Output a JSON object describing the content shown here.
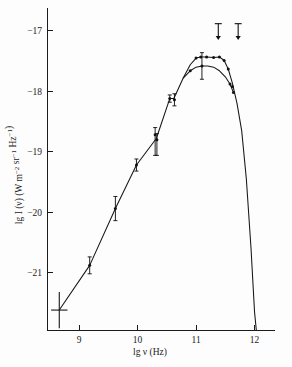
{
  "figure": {
    "title": "",
    "background_color": "#fdfdfd",
    "ink_color": "#161616"
  },
  "chart_data": {
    "type": "line",
    "title": "",
    "subtitle": "",
    "xlabel": "lg  ν  (Hz)",
    "ylabel": "lg I (ν) (W m⁻² sr⁻¹ Hz⁻¹)",
    "xlabel_parts": {
      "prefix": "lg",
      "variable": "ν",
      "unit": "(Hz)"
    },
    "ylabel_parts": {
      "prefix": "lg I (",
      "variable": "ν",
      "middle": ") (W m",
      "exp1": "−2",
      "mid2": " sr",
      "exp2": "−1",
      "mid3": " Hz",
      "exp3": "−1",
      "suffix": ")"
    },
    "xlim": [
      8.45,
      12.35
    ],
    "ylim": [
      -21.95,
      -16.72
    ],
    "xticks": [
      9,
      10,
      11,
      12
    ],
    "xtick_labels": [
      "9",
      "10",
      "11",
      "12"
    ],
    "yticks": [
      -17,
      -18,
      -19,
      -20,
      -21
    ],
    "ytick_labels": [
      "−17",
      "−18",
      "−19",
      "−20",
      "−21"
    ],
    "grid": false,
    "legend": null,
    "series": [
      {
        "name": "main-spectrum",
        "style": "solid-line-with-points",
        "x": [
          8.66,
          9.18,
          9.62,
          9.98,
          10.32,
          10.55,
          10.62,
          10.78,
          10.9,
          11.0,
          11.08,
          11.18,
          11.3,
          11.4,
          11.48,
          11.55,
          11.62,
          11.7,
          11.78,
          11.86,
          11.94,
          12.0,
          12.03
        ],
        "y": [
          -21.62,
          -20.88,
          -19.94,
          -19.22,
          -18.78,
          -18.12,
          -18.12,
          -17.78,
          -17.56,
          -17.45,
          -17.43,
          -17.43,
          -17.44,
          -17.43,
          -17.49,
          -17.63,
          -17.86,
          -18.2,
          -18.65,
          -19.45,
          -20.6,
          -21.65,
          -21.95
        ]
      },
      {
        "name": "secondary-branch",
        "style": "solid-line-with-points",
        "x": [
          10.78,
          10.9,
          11.0,
          11.1,
          11.2,
          11.3,
          11.4,
          11.5,
          11.58,
          11.64
        ],
        "y": [
          -17.78,
          -17.66,
          -17.6,
          -17.58,
          -17.58,
          -17.6,
          -17.66,
          -17.76,
          -17.88,
          -18.02
        ]
      }
    ],
    "data_points": [
      {
        "x": 8.66,
        "y": -21.62,
        "yerr_up": 0.3,
        "yerr_down": 0.3,
        "xerr": 0.14,
        "marker": "cross"
      },
      {
        "x": 9.18,
        "y": -20.88,
        "yerr_up": 0.14,
        "yerr_down": 0.14,
        "marker": "point"
      },
      {
        "x": 9.62,
        "y": -19.94,
        "yerr_up": 0.2,
        "yerr_down": 0.2,
        "marker": "point"
      },
      {
        "x": 9.98,
        "y": -19.22,
        "yerr_up": 0.1,
        "yerr_down": 0.1,
        "marker": "point"
      },
      {
        "x": 10.3,
        "y": -18.72,
        "yerr_up": 0.12,
        "yerr_down": 0.34,
        "marker": "point"
      },
      {
        "x": 10.33,
        "y": -18.8,
        "yerr_up": 0.1,
        "yerr_down": 0.26,
        "marker": "point"
      },
      {
        "x": 10.55,
        "y": -18.12,
        "yerr_up": 0.06,
        "yerr_down": 0.06,
        "marker": "point"
      },
      {
        "x": 10.63,
        "y": -18.14,
        "yerr_up": 0.1,
        "yerr_down": 0.1,
        "marker": "point"
      },
      {
        "x": 10.9,
        "y": -17.66,
        "yerr_up": 0.0,
        "yerr_down": 0.0,
        "marker": "point"
      },
      {
        "x": 11.0,
        "y": -17.45,
        "yerr_up": 0.0,
        "yerr_down": 0.0,
        "marker": "point"
      },
      {
        "x": 11.08,
        "y": -17.43,
        "yerr_up": 0.0,
        "yerr_down": 0.0,
        "marker": "point"
      },
      {
        "x": 11.18,
        "y": -17.43,
        "yerr_up": 0.0,
        "yerr_down": 0.0,
        "marker": "point"
      },
      {
        "x": 11.3,
        "y": -17.44,
        "yerr_up": 0.0,
        "yerr_down": 0.0,
        "marker": "point"
      },
      {
        "x": 11.4,
        "y": -17.43,
        "yerr_up": 0.0,
        "yerr_down": 0.0,
        "marker": "point"
      },
      {
        "x": 11.48,
        "y": -17.49,
        "yerr_up": 0.0,
        "yerr_down": 0.0,
        "marker": "point"
      },
      {
        "x": 11.1,
        "y": -17.58,
        "yerr_up": 0.22,
        "yerr_down": 0.22,
        "marker": "point"
      },
      {
        "x": 11.55,
        "y": -17.63,
        "yerr_up": 0.0,
        "yerr_down": 0.0,
        "marker": "point"
      },
      {
        "x": 11.58,
        "y": -17.88,
        "yerr_up": 0.0,
        "yerr_down": 0.0,
        "marker": "point"
      },
      {
        "x": 11.64,
        "y": -18.02,
        "yerr_up": 0.0,
        "yerr_down": 0.0,
        "marker": "point"
      },
      {
        "x": 11.62,
        "y": -17.92,
        "yerr_up": 0.0,
        "yerr_down": 0.0,
        "marker": "point"
      }
    ],
    "upper_limits": [
      {
        "x": 11.38,
        "y": -16.88,
        "length": 0.27
      },
      {
        "x": 11.72,
        "y": -16.88,
        "length": 0.27
      }
    ],
    "annotations": []
  }
}
